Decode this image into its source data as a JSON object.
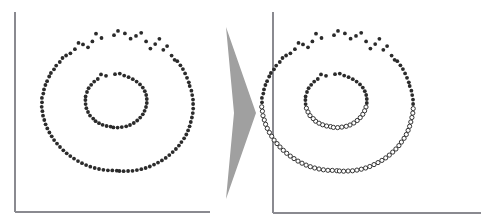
{
  "figure": {
    "title": "",
    "background_color": "#ffffff",
    "width": 481,
    "height": 224,
    "panel_count": 2
  },
  "arrow": {
    "name": "transformation-arrow",
    "direction": "right",
    "color": "#a0a0a0",
    "x_start": 226,
    "x_tip": 256,
    "y_top": 27,
    "y_bottom": 199,
    "y_mid": 113
  },
  "panels": [
    {
      "id": "left-panel",
      "label": "",
      "axis_color": "#8a8a90",
      "axis": {
        "x": 15,
        "y_top": 12,
        "y_bottom": 212,
        "x_right": 210
      },
      "marker_style": "all-filled",
      "filled_color": "#2b2b2b",
      "hollow_stroke": "#2b2b2b",
      "filled_radius": 1.9,
      "hollow_radius": 2.1
    },
    {
      "id": "right-panel",
      "label": "",
      "axis_color": "#8a8a90",
      "axis": {
        "x": 273,
        "y_top": 12,
        "y_bottom": 213,
        "x_right": 481
      },
      "marker_style": "split-by-boundary",
      "split_boundary_y": 106,
      "filled_color": "#2b2b2b",
      "hollow_stroke": "#2b2b2b",
      "filled_radius": 1.9,
      "hollow_radius": 2.1
    }
  ],
  "chart_data": {
    "type": "scatter",
    "title": "",
    "subtitle": "",
    "xlabel": "",
    "ylabel": "",
    "grid": false,
    "legend": null,
    "annotations": [
      {
        "name": "transformation-arrow",
        "text": "",
        "from_panel": "left-panel",
        "to_panel": "right-panel"
      }
    ],
    "panels": [
      {
        "name": "left-panel",
        "xlim": [
          15,
          210
        ],
        "ylim": [
          12,
          212
        ],
        "series": [
          {
            "name": "outer-ring",
            "marker": "filled-dot",
            "center": [
              114,
              107
            ],
            "mean_radius": 72,
            "radius_jitter": 9,
            "n": 96
          },
          {
            "name": "inner-ring",
            "marker": "filled-dot",
            "center": [
              115,
              105
            ],
            "mean_radius": 31,
            "radius_jitter": 6,
            "n": 42
          }
        ]
      },
      {
        "name": "right-panel",
        "xlim": [
          273,
          470
        ],
        "ylim": [
          12,
          213
        ],
        "split_boundary_y": 106,
        "series": [
          {
            "name": "outer-ring",
            "marker": "filled-dot-above-open-circle-below",
            "center": [
              334,
              107
            ],
            "mean_radius": 72,
            "radius_jitter": 9,
            "n": 96
          },
          {
            "name": "inner-ring",
            "marker": "filled-dot-above-open-circle-below",
            "center": [
              335,
              105
            ],
            "mean_radius": 31,
            "radius_jitter": 6,
            "n": 42
          }
        ]
      }
    ],
    "points": {
      "outer_ring": [
        [
          114.0,
          35.2
        ],
        [
          124.9,
          33.4
        ],
        [
          101.5,
          38.0
        ],
        [
          136.0,
          35.9
        ],
        [
          92.4,
          41.4
        ],
        [
          146.1,
          41.4
        ],
        [
          83.0,
          44.4
        ],
        [
          155.2,
          44.1
        ],
        [
          74.9,
          49.2
        ],
        [
          163.3,
          49.8
        ],
        [
          66.1,
          55.5
        ],
        [
          171.6,
          55.6
        ],
        [
          59.8,
          62.0
        ],
        [
          177.3,
          61.2
        ],
        [
          54.0,
          69.3
        ],
        [
          182.9,
          69.1
        ],
        [
          49.2,
          76.5
        ],
        [
          187.0,
          77.8
        ],
        [
          45.4,
          85.0
        ],
        [
          189.7,
          86.0
        ],
        [
          43.3,
          93.6
        ],
        [
          192.2,
          95.1
        ],
        [
          42.0,
          102.3
        ],
        [
          193.1,
          104.0
        ],
        [
          42.4,
          111.2
        ],
        [
          192.8,
          113.1
        ],
        [
          44.3,
          120.0
        ],
        [
          190.8,
          122.0
        ],
        [
          47.3,
          128.4
        ],
        [
          188.1,
          130.4
        ],
        [
          51.7,
          136.3
        ],
        [
          184.1,
          138.3
        ],
        [
          57.0,
          143.6
        ],
        [
          178.9,
          145.6
        ],
        [
          63.3,
          150.3
        ],
        [
          172.7,
          152.1
        ],
        [
          70.3,
          156.1
        ],
        [
          165.7,
          157.9
        ],
        [
          78.0,
          161.1
        ],
        [
          158.0,
          162.6
        ],
        [
          86.1,
          165.1
        ],
        [
          149.8,
          166.5
        ],
        [
          94.7,
          168.0
        ],
        [
          141.3,
          169.2
        ],
        [
          103.4,
          169.8
        ],
        [
          132.5,
          170.8
        ],
        [
          112.3,
          170.4
        ],
        [
          123.6,
          171.2
        ],
        [
          118.0,
          30.9
        ],
        [
          130.6,
          38.7
        ],
        [
          96.0,
          33.7
        ],
        [
          141.2,
          32.8
        ],
        [
          88.0,
          47.3
        ],
        [
          150.4,
          48.6
        ],
        [
          78.5,
          42.9
        ],
        [
          159.4,
          38.8
        ],
        [
          70.4,
          53.3
        ],
        [
          167.1,
          46.1
        ],
        [
          62.5,
          58.0
        ],
        [
          174.6,
          59.8
        ],
        [
          56.2,
          65.6
        ],
        [
          180.4,
          65.3
        ],
        [
          50.9,
          73.0
        ],
        [
          185.1,
          73.4
        ],
        [
          47.1,
          81.2
        ],
        [
          188.8,
          82.3
        ],
        [
          44.0,
          89.4
        ],
        [
          191.4,
          90.7
        ],
        [
          41.9,
          97.9
        ],
        [
          193.0,
          99.6
        ],
        [
          41.7,
          106.8
        ],
        [
          193.2,
          108.6
        ],
        [
          43.0,
          115.7
        ],
        [
          191.9,
          117.5
        ],
        [
          45.6,
          124.3
        ],
        [
          189.6,
          126.3
        ],
        [
          49.4,
          132.5
        ],
        [
          186.3,
          134.5
        ],
        [
          54.1,
          140.1
        ],
        [
          181.4,
          142.1
        ],
        [
          60.0,
          147.0
        ],
        [
          175.9,
          149.0
        ],
        [
          66.7,
          153.3
        ],
        [
          169.3,
          155.1
        ],
        [
          74.0,
          158.6
        ],
        [
          161.9,
          160.4
        ],
        [
          82.0,
          163.2
        ],
        [
          154.0,
          164.6
        ],
        [
          90.3,
          166.7
        ],
        [
          145.6,
          168.0
        ],
        [
          99.0,
          169.0
        ],
        [
          136.9,
          170.1
        ],
        [
          107.9,
          170.3
        ],
        [
          128.1,
          171.0
        ],
        [
          116.8,
          170.7
        ],
        [
          119.4,
          171.0
        ]
      ],
      "inner_ring": [
        [
          115.0,
          74.2
        ],
        [
          124.2,
          75.6
        ],
        [
          106.0,
          75.8
        ],
        [
          132.8,
          79.2
        ],
        [
          97.8,
          79.0
        ],
        [
          140.0,
          84.4
        ],
        [
          91.2,
          84.8
        ],
        [
          144.8,
          91.2
        ],
        [
          87.0,
          92.0
        ],
        [
          146.8,
          99.0
        ],
        [
          85.4,
          100.0
        ],
        [
          146.0,
          107.0
        ],
        [
          86.4,
          108.2
        ],
        [
          142.8,
          114.3
        ],
        [
          90.0,
          115.6
        ],
        [
          137.2,
          120.5
        ],
        [
          95.6,
          121.2
        ],
        [
          130.0,
          125.0
        ],
        [
          102.6,
          124.8
        ],
        [
          121.8,
          127.1
        ],
        [
          110.6,
          126.6
        ],
        [
          113.4,
          127.4
        ],
        [
          119.8,
          73.6
        ],
        [
          128.6,
          77.2
        ],
        [
          101.0,
          74.4
        ],
        [
          136.6,
          81.6
        ],
        [
          94.2,
          81.6
        ],
        [
          142.8,
          87.6
        ],
        [
          88.6,
          88.2
        ],
        [
          146.2,
          95.0
        ],
        [
          85.6,
          96.4
        ],
        [
          146.8,
          103.0
        ],
        [
          85.6,
          104.1
        ],
        [
          144.6,
          110.8
        ],
        [
          88.0,
          112.0
        ],
        [
          140.2,
          117.6
        ],
        [
          93.2,
          118.6
        ],
        [
          133.8,
          123.0
        ],
        [
          99.0,
          123.2
        ],
        [
          126.2,
          126.3
        ],
        [
          106.6,
          126.0
        ],
        [
          117.6,
          127.6
        ]
      ]
    }
  }
}
